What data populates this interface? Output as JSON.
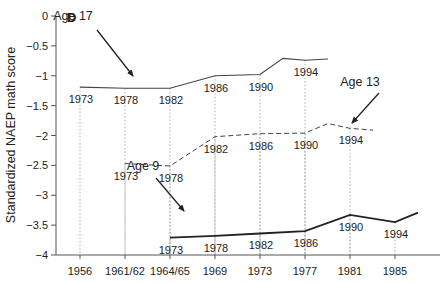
{
  "panel_label": "D",
  "chart_data": {
    "type": "line",
    "title": "",
    "panel_label": "D",
    "xlabel": "",
    "ylabel": "Standardized NAEP math score",
    "ylim": [
      -4,
      0
    ],
    "yticks": [
      "0",
      "−0.5",
      "−1",
      "−1.5",
      "−2",
      "−2.5",
      "−3",
      "−3.5",
      "−4"
    ],
    "ytick_values": [
      0,
      -0.5,
      -1,
      -1.5,
      -2,
      -2.5,
      -3,
      -3.5,
      -4
    ],
    "x_categories": [
      "1956",
      "1961/62",
      "1964/65",
      "1969",
      "1973",
      "1977",
      "1981",
      "1985"
    ],
    "x_axis_meaning": "birth cohort year",
    "grid": "dotted vertical drop lines from data points to x axis",
    "legend": "inline annotations with arrows",
    "series": [
      {
        "name": "Age 17",
        "style": "solid",
        "points": [
          {
            "test_year": "1973",
            "cohort": "1956",
            "value": -1.19
          },
          {
            "test_year": "1978",
            "cohort": "1961/62",
            "value": -1.21
          },
          {
            "test_year": "1982",
            "cohort": "1964/65",
            "value": -1.21
          },
          {
            "test_year": "1986",
            "cohort": "1969",
            "value": -1.0
          },
          {
            "test_year": "1990",
            "cohort": "1973",
            "value": -0.98
          },
          {
            "test_year": "",
            "cohort": "1975",
            "value": -0.71
          },
          {
            "test_year": "1994",
            "cohort": "1977",
            "value": -0.74
          },
          {
            "test_year": "",
            "cohort": "1979",
            "value": -0.72
          }
        ]
      },
      {
        "name": "Age 13",
        "style": "dashed",
        "points": [
          {
            "test_year": "1973",
            "cohort": "1961/62",
            "value": -2.47
          },
          {
            "test_year": "1978",
            "cohort": "1964/65",
            "value": -2.51
          },
          {
            "test_year": "1982",
            "cohort": "1969",
            "value": -2.02
          },
          {
            "test_year": "1986",
            "cohort": "1973",
            "value": -1.97
          },
          {
            "test_year": "1990",
            "cohort": "1977",
            "value": -1.96
          },
          {
            "test_year": "",
            "cohort": "1979",
            "value": -1.8
          },
          {
            "test_year": "1994",
            "cohort": "1981",
            "value": -1.88
          },
          {
            "test_year": "",
            "cohort": "1983",
            "value": -1.91
          }
        ]
      },
      {
        "name": "Age 9",
        "style": "solid-bold",
        "points": [
          {
            "test_year": "1973",
            "cohort": "1964/65",
            "value": -3.71
          },
          {
            "test_year": "1978",
            "cohort": "1969",
            "value": -3.68
          },
          {
            "test_year": "1982",
            "cohort": "1973",
            "value": -3.64
          },
          {
            "test_year": "1986",
            "cohort": "1977",
            "value": -3.6
          },
          {
            "test_year": "1990",
            "cohort": "1981",
            "value": -3.33
          },
          {
            "test_year": "1994",
            "cohort": "1985",
            "value": -3.45
          },
          {
            "test_year": "",
            "cohort": "1987",
            "value": -3.29
          }
        ]
      }
    ],
    "annotations": [
      "Age 17",
      "Age 13",
      "Age 9"
    ]
  }
}
